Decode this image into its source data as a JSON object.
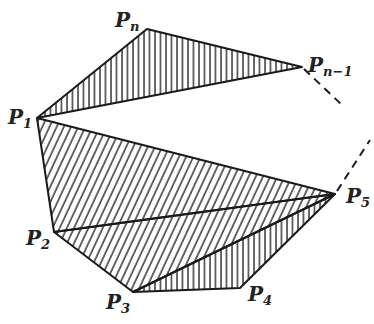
{
  "diagram": {
    "vertices": {
      "P1": {
        "label": "P",
        "sub": "1",
        "x": 37,
        "y": 118
      },
      "P2": {
        "label": "P",
        "sub": "2",
        "x": 54,
        "y": 232
      },
      "P3": {
        "label": "P",
        "sub": "3",
        "x": 133,
        "y": 292
      },
      "P4": {
        "label": "P",
        "sub": "4",
        "x": 240,
        "y": 288
      },
      "P5": {
        "label": "P",
        "sub": "5",
        "x": 335,
        "y": 194
      },
      "Pn_1": {
        "label": "P",
        "sub": "n−1",
        "x": 302,
        "y": 67
      },
      "Pn": {
        "label": "P",
        "sub": "n",
        "x": 147,
        "y": 29
      }
    },
    "triangles": [
      {
        "name": "P1-Pn-Pn-1",
        "hatch": "vertical"
      },
      {
        "name": "P1-P2-P5",
        "hatch": "diagonal"
      },
      {
        "name": "P2-P3-P5",
        "hatch": "diagonal"
      },
      {
        "name": "P3-P4-P5",
        "hatch": "vertical"
      }
    ],
    "dashed_edges": [
      "Pn-1 continuation",
      "P5 continuation"
    ],
    "line_color": "#1a1a1a"
  }
}
